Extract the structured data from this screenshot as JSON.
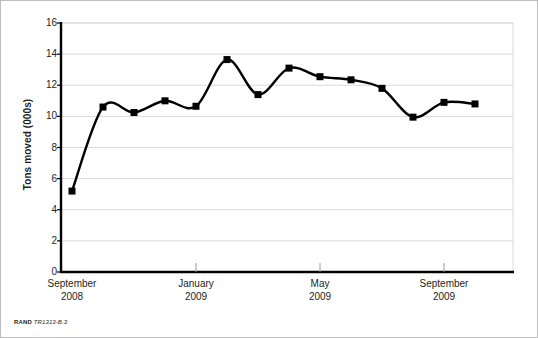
{
  "figure": {
    "credit_mark": "RAND",
    "figure_id": "TR1313-B.3"
  },
  "chart_data": {
    "type": "line",
    "title": "",
    "xlabel": "",
    "ylabel": "Tons moved (000s)",
    "ylim": [
      0,
      16
    ],
    "ytick_values": [
      16,
      14,
      12,
      10,
      8,
      6,
      4,
      2,
      0
    ],
    "ytick_labels": [
      "16",
      "14",
      "12",
      "10",
      "8",
      "6",
      "4",
      "2",
      "0"
    ],
    "grid": "horizontal",
    "legend": "none",
    "x_tick_labels": [
      {
        "month": "September",
        "year": "2008",
        "index": 0
      },
      {
        "month": "January",
        "year": "2009",
        "index": 4
      },
      {
        "month": "May",
        "year": "2009",
        "index": 8
      },
      {
        "month": "September",
        "year": "2009",
        "index": 12
      }
    ],
    "categories": [
      "September 2008",
      "October 2008",
      "November 2008",
      "December 2008",
      "January 2009",
      "February 2009",
      "March 2009",
      "April 2009",
      "May 2009",
      "June 2009",
      "July 2009",
      "August 2009",
      "September 2009",
      "October 2009"
    ],
    "values": [
      5.2,
      10.6,
      10.25,
      11.0,
      10.65,
      13.65,
      11.4,
      13.1,
      12.55,
      12.35,
      11.8,
      9.95,
      10.9,
      10.8
    ],
    "series_color": "#000000",
    "marker": "square",
    "gridline_color": "#d9d9d9",
    "axis_color": "#000000"
  }
}
